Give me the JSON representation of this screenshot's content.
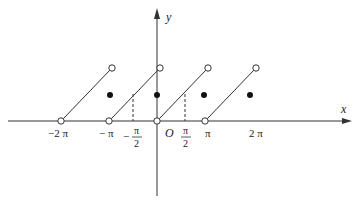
{
  "diagram": {
    "title": "",
    "axes": {
      "x_label": "x",
      "y_label": "y",
      "origin_label": "O"
    },
    "tick_labels": [
      {
        "id": "neg2pi",
        "text": "−2 π"
      },
      {
        "id": "negpi",
        "text": "− π"
      },
      {
        "id": "neghalfpi_sign",
        "text": "−"
      },
      {
        "id": "neghalfpi_num",
        "text": "π"
      },
      {
        "id": "neghalfpi_den",
        "text": "2"
      },
      {
        "id": "halfpi_num",
        "text": "π"
      },
      {
        "id": "halfpi_den",
        "text": "2"
      },
      {
        "id": "pi",
        "text": "π"
      },
      {
        "id": "twopi",
        "text": "2 π"
      }
    ],
    "segments": [
      {
        "from": "(-2π, 0) open",
        "to": "(-π, π) open"
      },
      {
        "from": "(-π, 0) open",
        "to": "(0, π) open"
      },
      {
        "from": "(0, 0) open",
        "to": "(π, π) open"
      },
      {
        "from": "(π, 0) open",
        "to": "(2π, π) open"
      }
    ],
    "filled_points": [
      "(-π, π/2)",
      "(0, π/2)",
      "(π, π/2)",
      "(2π, π/2)"
    ],
    "dashed_guides": [
      "x = −π/2",
      "x = π/2"
    ]
  }
}
